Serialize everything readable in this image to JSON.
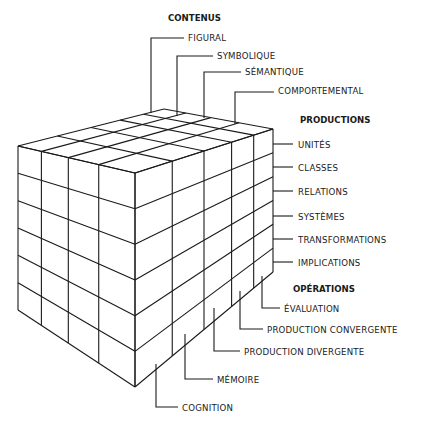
{
  "diagram": {
    "type": "3d-cube-model",
    "contenus": {
      "title": "CONTENUS",
      "items": [
        "FIGURAL",
        "SYMBOLIQUE",
        "SÉMANTIQUE",
        "COMPORTEMENTAL"
      ]
    },
    "productions": {
      "title": "PRODUCTIONS",
      "items": [
        "UNITÉS",
        "CLASSES",
        "RELATIONS",
        "SYSTÈMES",
        "TRANSFORMATIONS",
        "IMPLICATIONS"
      ]
    },
    "operations": {
      "title": "OPÉRATIONS",
      "items": [
        "ÉVALUATION",
        "PRODUCTION CONVERGENTE",
        "PRODUCTION DIVERGENTE",
        "MÉMOIRE",
        "COGNITION"
      ]
    },
    "line_color": "#1a1a1a",
    "background": "#ffffff"
  }
}
